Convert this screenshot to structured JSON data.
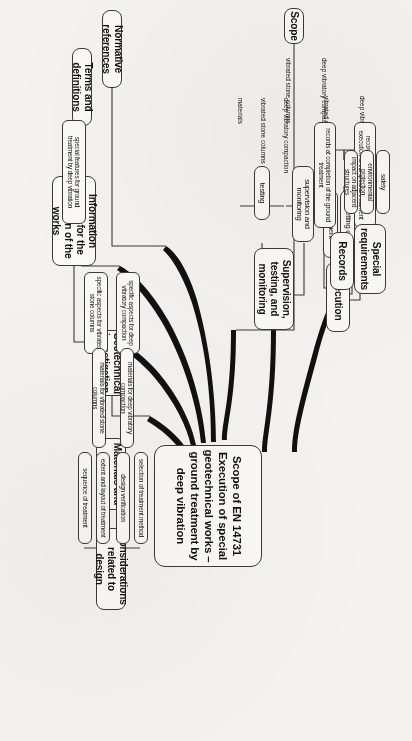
{
  "diagram": {
    "title": "Scope of EN 14731 Execution of special geotechnical works – ground treatment by deep vibration",
    "type": "mind-map",
    "orientation": "rotated-90-clockwise",
    "central": {
      "label": "Scope of EN 14731 Execution of special geotechnical works – ground treatment by deep vibration",
      "lines": [
        "Scope of EN 14731",
        "Execution of special",
        "geotechnical works –",
        "ground treatment by",
        "deep vibration"
      ]
    },
    "branches": [
      {
        "id": "execution",
        "label": "Execution",
        "children": [
          {
            "label": "site preparation",
            "children": []
          },
          {
            "label": "setting out",
            "children": []
          },
          {
            "label": "treatment",
            "children": [
              {
                "label": "deep vibratory compaction"
              },
              {
                "label": "vibrated stone columns"
              }
            ]
          }
        ]
      },
      {
        "id": "supervision",
        "label": "Supervision, testing, and monitoring",
        "lines": [
          "Supervision,",
          "testing, and",
          "monitoring"
        ],
        "children": [
          {
            "label": "supervision and monitoring",
            "lines": [
              "supervision and",
              "monitoring"
            ],
            "children": [
              {
                "label": "deep vibratory compaction"
              },
              {
                "label": "vibrated stone columns"
              }
            ]
          },
          {
            "label": "testing",
            "children": [
              {
                "label": "deep vibratory compaction"
              },
              {
                "label": "vibrated stone columns"
              },
              {
                "label": "materials"
              }
            ]
          }
        ]
      },
      {
        "id": "records",
        "label": "Records",
        "children": [
          {
            "label": "records in connection with the execution of the ground treatment",
            "lines": [
              "records in connection with the",
              "execution of the ground treatment"
            ],
            "children": []
          },
          {
            "label": "records at completion of the ground treatment",
            "lines": [
              "records at completion of the",
              "ground treatment"
            ],
            "children": []
          }
        ]
      },
      {
        "id": "special-requirements",
        "label": "Special requirements",
        "lines": [
          "Special",
          "requirements"
        ],
        "children": [
          {
            "label": "safety",
            "children": []
          },
          {
            "label": "environmental protection",
            "children": []
          },
          {
            "label": "impact on adjacent structures",
            "children": []
          }
        ]
      },
      {
        "id": "scope",
        "label": "Scope",
        "children": []
      },
      {
        "id": "normative-references",
        "label": "Normative references",
        "children": []
      },
      {
        "id": "terms-and-definitions",
        "label": "Terms and definitions",
        "children": []
      },
      {
        "id": "information-needed",
        "label": "Information needed for the execution of the works",
        "lines": [
          "Information needed",
          "for the execution of",
          "the works"
        ],
        "children": [
          {
            "label": "special features for ground treatment by deep vibration",
            "lines": [
              "special features for ground",
              "treatment by deep vibration"
            ],
            "children": []
          }
        ]
      },
      {
        "id": "geotechnical-investigation",
        "label": "Geotechnical investigation",
        "lines": [
          "Geotechnical",
          "investigation"
        ],
        "children": [
          {
            "label": "specific aspects for deep vibratory compaction",
            "lines": [
              "specific aspects for",
              "deep vibratory",
              "compaction"
            ],
            "children": []
          },
          {
            "label": "specific aspects for vibrated stone columns",
            "lines": [
              "specific aspects for",
              "vibrated stone",
              "columns"
            ],
            "children": []
          }
        ]
      },
      {
        "id": "materials-and-products",
        "label": "Materials and products",
        "lines": [
          "Materials and",
          "products"
        ],
        "children": [
          {
            "label": "materials for deep vibratory compaction",
            "children": []
          },
          {
            "label": "materials for vibrated stone columns",
            "children": []
          }
        ]
      },
      {
        "id": "considerations-related-to-design",
        "label": "Considerations related to design",
        "lines": [
          "Considerations",
          "related to design"
        ],
        "children": [
          {
            "label": "selection of treatment method",
            "children": []
          },
          {
            "label": "design verification",
            "children": []
          },
          {
            "label": "extent and layout of treatment",
            "children": []
          },
          {
            "label": "sequence of treatment",
            "children": []
          }
        ]
      }
    ]
  },
  "colors": {
    "background": "#f4f3f1",
    "node_fill": "#fbfaf8",
    "stroke": "#3a3a3a",
    "text": "#111111"
  }
}
